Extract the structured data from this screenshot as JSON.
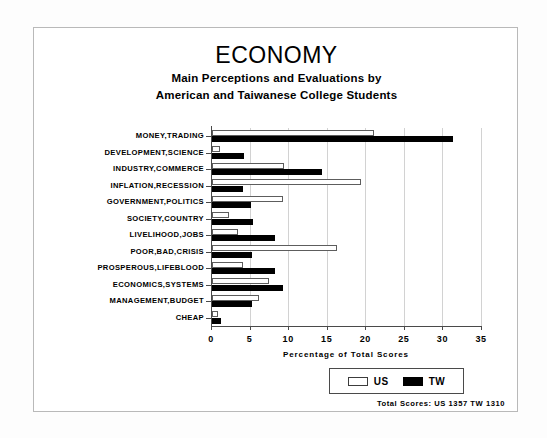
{
  "chart_data": {
    "type": "bar",
    "orientation": "horizontal",
    "title": "ECONOMY",
    "subtitle_line1": "Main Perceptions and Evaluations by",
    "subtitle_line2": "American and Taiwanese College Students",
    "xlabel": "Percentage of Total Scores",
    "ylabel": "",
    "xlim": [
      0,
      35
    ],
    "xticks": [
      0,
      5,
      10,
      15,
      20,
      25,
      30,
      35
    ],
    "xtick_labels": [
      "0",
      "5",
      "10",
      "15",
      "20",
      "25",
      "30",
      "35"
    ],
    "grid": "vertical",
    "legend_position": "bottom-right",
    "categories": [
      "MONEY,TRADING",
      "DEVELOPMENT,SCIENCE",
      "INDUSTRY,COMMERCE",
      "INFLATION,RECESSION",
      "GOVERNMENT,POLITICS",
      "SOCIETY,COUNTRY",
      "LIVELIHOOD,JOBS",
      "POOR,BAD,CRISIS",
      "PROSPEROUS,LIFEBLOOD",
      "ECONOMICS,SYSTEMS",
      "MANAGEMENT,BUDGET",
      "CHEAP"
    ],
    "series": [
      {
        "name": "US",
        "color": "#ffffff",
        "edge_color": "#000000",
        "values": [
          21.0,
          1.0,
          9.3,
          19.3,
          9.2,
          2.2,
          3.4,
          16.2,
          4.0,
          7.4,
          6.1,
          0.8
        ]
      },
      {
        "name": "TW",
        "color": "#000000",
        "edge_color": "#000000",
        "values": [
          31.3,
          4.1,
          14.3,
          4.0,
          5.0,
          5.3,
          8.2,
          5.2,
          8.2,
          9.2,
          5.2,
          1.2
        ]
      }
    ],
    "annotations": {
      "totals": "Total Scores:  US 1357   TW 1310"
    }
  },
  "legend": {
    "items": [
      {
        "label": "US",
        "swatch": "white-square"
      },
      {
        "label": "TW",
        "swatch": "black-square"
      }
    ]
  }
}
